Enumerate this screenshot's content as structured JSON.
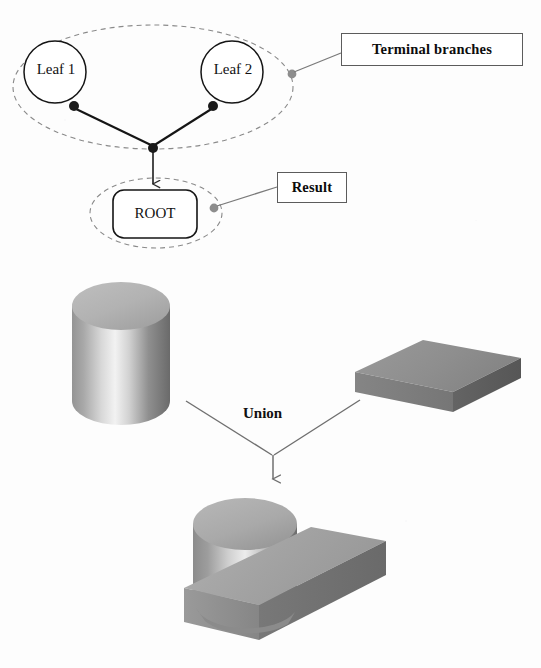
{
  "figure": {
    "title_caption": "",
    "background_color": "#fdfdfd",
    "ink_color": "#111111",
    "callout_line_color": "#7a7a7a",
    "dashed_ellipse_color": "#8a8a8a"
  },
  "tree": {
    "leaf1_label": "Leaf 1",
    "leaf2_label": "Leaf 2",
    "root_label": "ROOT",
    "callouts": [
      {
        "id": "terminal-branches",
        "label": "Terminal branches"
      },
      {
        "id": "result",
        "label": "Result"
      }
    ]
  },
  "operation": {
    "label": "Union"
  },
  "solids": {
    "operand_a": "cylinder",
    "operand_b": "rectangular-block",
    "result": "cylinder-block-union"
  },
  "colors": {
    "cylinder_top": "#b4b4b4",
    "cylinder_body_light": "#f0f0f0",
    "cylinder_body_dark": "#6d6d6d",
    "block_top": "#8f8f8f",
    "block_front": "#7b7b7b",
    "block_side": "#5e5e5e",
    "result_top": "#a8a8a8",
    "result_front": "#8d8d8d",
    "result_side": "#6f6f6f"
  }
}
